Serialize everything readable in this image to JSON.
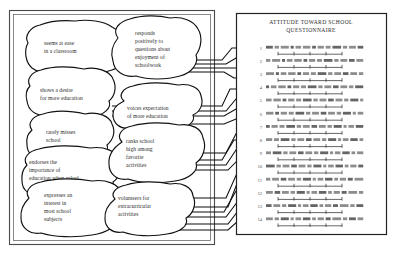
{
  "figure": {
    "left_panel": {
      "name": "behavior-indicator-panel",
      "blobs": [
        {
          "id": "blob-seems-at-ease",
          "text": "seems at ease in a classroom"
        },
        {
          "id": "blob-responds-positively",
          "text": "responds positively to questions about enjoyment of schoolwork"
        },
        {
          "id": "blob-shows-desire",
          "text": "shows a desire for more education"
        },
        {
          "id": "blob-voices-expectation",
          "text": "voices expectation of more education"
        },
        {
          "id": "blob-rarely-misses",
          "text": "rarely misses school"
        },
        {
          "id": "blob-endorses-importance",
          "text": "endorses the importance of education when asked"
        },
        {
          "id": "blob-ranks-school-high",
          "text": "ranks school high among favorite activities"
        },
        {
          "id": "blob-expresses-interest",
          "text": "expresses an interest in most school subjects"
        },
        {
          "id": "blob-volunteers",
          "text": "volunteers for extracurricular activities"
        }
      ]
    },
    "right_panel": {
      "name": "questionnaire-panel",
      "title_line_1": "ATTITUDE  TOWARD SCHOOL",
      "title_line_2": "QUESTIONNAIRE",
      "items": [
        {
          "number": "1",
          "text": "illegible scanned questionnaire item",
          "scale_ticks": 5
        },
        {
          "number": "2",
          "text": "illegible scanned questionnaire item",
          "scale_ticks": 5
        },
        {
          "number": "3",
          "text": "illegible scanned questionnaire item",
          "scale_ticks": 5
        },
        {
          "number": "4",
          "text": "illegible scanned questionnaire item",
          "scale_ticks": 5
        },
        {
          "number": "5",
          "text": "illegible scanned questionnaire item",
          "scale_ticks": 5
        },
        {
          "number": "6",
          "text": "illegible scanned questionnaire item",
          "scale_ticks": 5
        },
        {
          "number": "7",
          "text": "illegible scanned questionnaire item",
          "scale_ticks": 5
        },
        {
          "number": "8",
          "text": "illegible scanned questionnaire item",
          "scale_ticks": 5
        },
        {
          "number": "9",
          "text": "illegible scanned questionnaire item",
          "scale_ticks": 5
        },
        {
          "number": "10",
          "text": "illegible scanned questionnaire item",
          "scale_ticks": 5
        },
        {
          "number": "11",
          "text": "illegible scanned questionnaire item",
          "scale_ticks": 5
        },
        {
          "number": "12",
          "text": "illegible scanned questionnaire item",
          "scale_ticks": 5
        },
        {
          "number": "13",
          "text": "illegible scanned questionnaire item",
          "scale_ticks": 5
        },
        {
          "number": "14",
          "text": "illegible scanned questionnaire item",
          "scale_ticks": 5
        }
      ]
    },
    "colors": {
      "ink": "#111111",
      "blob_text": "#2b2b2b",
      "panel_border": "#4a4a4a",
      "faded_item_text": "#4a4a4a",
      "background": "#ffffff"
    }
  }
}
